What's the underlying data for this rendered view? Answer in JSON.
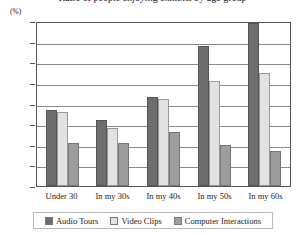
{
  "title": "Ratio of people enjoying exhibits by age group",
  "y_unit": "(%)",
  "chart_data": {
    "type": "bar",
    "title": "Ratio of people enjoying exhibits by age group",
    "xlabel": "",
    "ylabel": "(%)",
    "ylim": [
      0,
      40
    ],
    "ytick_step": 5,
    "yticks": [
      40,
      35,
      30,
      25,
      20,
      15,
      10,
      5,
      0
    ],
    "grid": true,
    "legend_position": "bottom",
    "categories": [
      "Under 30",
      "In my 30s",
      "In my 40s",
      "In my 50s",
      "In my 60s"
    ],
    "series": [
      {
        "name": "Audio Tours",
        "color": "#6e6e6e",
        "values": [
          18.5,
          16.0,
          21.5,
          34.0,
          39.5
        ]
      },
      {
        "name": "Video Clips",
        "color": "#e2e2e2",
        "values": [
          18.0,
          14.0,
          21.0,
          25.5,
          27.5
        ]
      },
      {
        "name": "Computer Interactions",
        "color": "#9d9d9d",
        "values": [
          10.5,
          10.5,
          13.0,
          10.0,
          8.5
        ]
      }
    ]
  }
}
